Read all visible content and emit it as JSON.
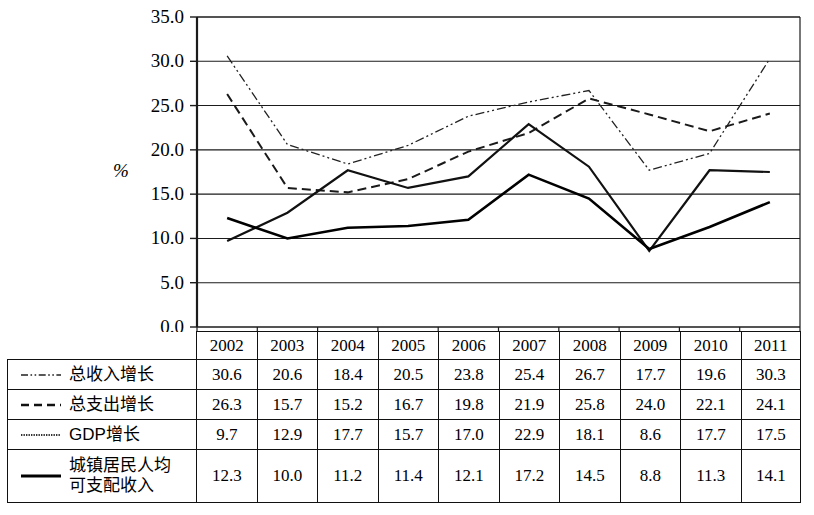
{
  "chart_data": {
    "type": "line",
    "title": "",
    "xlabel": "",
    "ylabel": "%",
    "ylim": [
      0.0,
      35.0
    ],
    "ytick_labels": [
      "35.0",
      "30.0",
      "25.0",
      "20.0",
      "15.0",
      "10.0",
      "5.0",
      "0.0"
    ],
    "ytick_values": [
      35.0,
      30.0,
      25.0,
      20.0,
      15.0,
      10.0,
      5.0,
      0.0
    ],
    "grid": true,
    "legend_position": "table-row-labels",
    "categories": [
      "2002",
      "2003",
      "2004",
      "2005",
      "2006",
      "2007",
      "2008",
      "2009",
      "2010",
      "2011"
    ],
    "series": [
      {
        "name": "总收入增长",
        "line_style": "dash-dot-dot",
        "color": "#222222",
        "width": 1.3,
        "values": [
          30.6,
          20.6,
          18.4,
          20.5,
          23.8,
          25.4,
          26.7,
          17.7,
          19.6,
          30.3
        ]
      },
      {
        "name": "总支出增长",
        "line_style": "dashed",
        "color": "#1a1a1a",
        "width": 2.0,
        "values": [
          26.3,
          15.7,
          15.2,
          16.7,
          19.8,
          21.9,
          25.8,
          24.0,
          22.1,
          24.1
        ]
      },
      {
        "name": "GDP增长",
        "line_style": "solid-thin",
        "color": "#111111",
        "width": 2.2,
        "values": [
          9.7,
          12.9,
          17.7,
          15.7,
          17.0,
          22.9,
          18.1,
          8.6,
          17.7,
          17.5
        ]
      },
      {
        "name": "城镇居民人均\n可支配收入",
        "line_style": "solid-thick",
        "color": "#000000",
        "width": 2.6,
        "values": [
          12.3,
          10.0,
          11.2,
          11.4,
          12.1,
          17.2,
          14.5,
          8.8,
          11.3,
          14.1
        ]
      }
    ]
  },
  "table": {
    "year_header": [
      "2002",
      "2003",
      "2004",
      "2005",
      "2006",
      "2007",
      "2008",
      "2009",
      "2010",
      "2011"
    ],
    "rows": [
      {
        "label": "总收入增长",
        "swatch": "dash-dot-dot-line-icon",
        "values": [
          "30.6",
          "20.6",
          "18.4",
          "20.5",
          "23.8",
          "25.4",
          "26.7",
          "17.7",
          "19.6",
          "30.3"
        ]
      },
      {
        "label": "总支出增长",
        "swatch": "dashed-line-icon",
        "values": [
          "26.3",
          "15.7",
          "15.2",
          "16.7",
          "19.8",
          "21.9",
          "25.8",
          "24.0",
          "22.1",
          "24.1"
        ]
      },
      {
        "label": "GDP增长",
        "swatch": "dotted-line-icon",
        "values": [
          "9.7",
          "12.9",
          "17.7",
          "15.7",
          "17.0",
          "22.9",
          "18.1",
          "8.6",
          "17.7",
          "17.5"
        ]
      },
      {
        "label": "城镇居民人均\n可支配收入",
        "swatch": "solid-thick-line-icon",
        "values": [
          "12.3",
          "10.0",
          "11.2",
          "11.4",
          "12.1",
          "17.2",
          "14.5",
          "8.8",
          "11.3",
          "14.1"
        ]
      }
    ]
  }
}
